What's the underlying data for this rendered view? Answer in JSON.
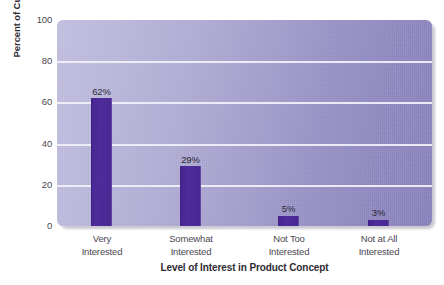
{
  "chart_data": {
    "type": "bar",
    "title": "",
    "xlabel": "Level of Interest in Product Concept",
    "ylabel": "Percent of Customers",
    "categories": [
      "Very Interested",
      "Somewhat Interested",
      "Not Too Interested",
      "Not at All Interested"
    ],
    "category_lines": [
      [
        "Very",
        "Interested"
      ],
      [
        "Somewhat",
        "Interested"
      ],
      [
        "Not Too",
        "Interested"
      ],
      [
        "Not at All",
        "Interested"
      ]
    ],
    "values": [
      62,
      29,
      5,
      3
    ],
    "data_labels": [
      "62%",
      "29%",
      "5%",
      "3%"
    ],
    "ylim": [
      0,
      100
    ],
    "yticks": [
      0,
      20,
      40,
      60,
      80,
      100
    ],
    "ytick_labels": [
      "0",
      "20",
      "40",
      "60",
      "80",
      "100"
    ],
    "grid": "horizontal",
    "legend": "none",
    "colors": {
      "bar": "#4a2a96",
      "plot_background_left": "#c3c0e2",
      "plot_background_right": "#8b84bf",
      "gridline": "#f2f1f8",
      "tick_text": "#4b4852",
      "axis_title_text": "#2e2b33",
      "page_background": "#ffffff"
    }
  }
}
